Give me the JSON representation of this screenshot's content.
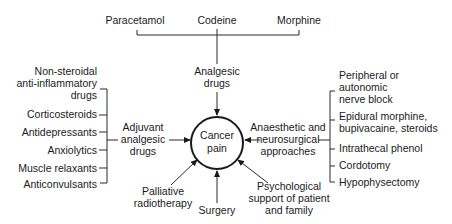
{
  "diagram": {
    "center": {
      "lines": [
        "Cancer",
        "pain"
      ]
    },
    "top_drugs": [
      "Paracetamol",
      "Codeine",
      "Morphine"
    ],
    "analgesic": {
      "lines": [
        "Analgesic",
        "drugs"
      ]
    },
    "adjuvant": {
      "lines": [
        "Adjuvant",
        "analgesic",
        "drugs"
      ],
      "items": [
        {
          "lines": [
            "Non-steroidal",
            "anti-inflammatory",
            "drugs"
          ]
        },
        {
          "lines": [
            "Corticosteroids"
          ]
        },
        {
          "lines": [
            "Antidepressants"
          ]
        },
        {
          "lines": [
            "Anxiolytics"
          ]
        },
        {
          "lines": [
            "Muscle relaxants"
          ]
        },
        {
          "lines": [
            "Anticonvulsants"
          ]
        }
      ]
    },
    "anaesthetic": {
      "lines": [
        "Anaesthetic and",
        "neurosurgical",
        "approaches"
      ],
      "items": [
        {
          "lines": [
            "Peripheral or",
            "autonomic",
            "nerve block"
          ]
        },
        {
          "lines": [
            "Epidural morphine,",
            "bupivacaine, steroids"
          ]
        },
        {
          "lines": [
            "Intrathecal phenol"
          ]
        },
        {
          "lines": [
            "Cordotomy"
          ]
        },
        {
          "lines": [
            "Hypophysectomy"
          ]
        }
      ]
    },
    "palliative": {
      "lines": [
        "Palliative",
        "radiotherapy"
      ]
    },
    "surgery": {
      "lines": [
        "Surgery"
      ]
    },
    "psychological": {
      "lines": [
        "Psychological",
        "support of patient",
        "and family"
      ]
    }
  }
}
